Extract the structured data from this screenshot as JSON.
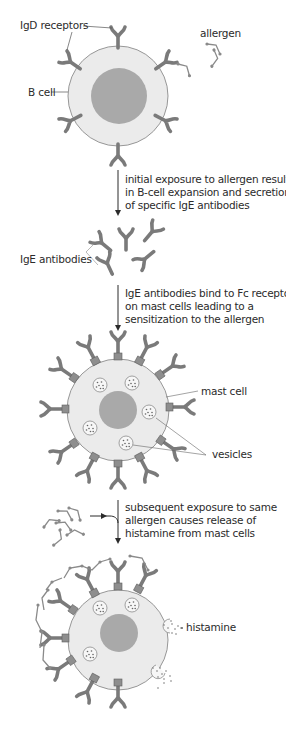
{
  "diagram": {
    "colors": {
      "cell_fill": "#ebebeb",
      "cell_stroke": "#8c8c8c",
      "nucleus": "#a9a9a9",
      "receptor": "#7a7a7a",
      "fc_receptor": "#8a8a8a",
      "allergen": "#8a8a8a",
      "text": "#2b2b2b",
      "arrow": "#2b2b2b"
    },
    "stage1": {
      "labels": {
        "igd_receptors": "IgD receptors",
        "b_cell": "B cell",
        "allergen": "allergen"
      }
    },
    "step1": {
      "caption_lines": [
        "initial exposure to allergen results",
        "in B-cell expansion and secretion",
        "of specific IgE antibodies"
      ]
    },
    "stage2": {
      "labels": {
        "ige_antibodies": "IgE antibodies"
      }
    },
    "step2": {
      "caption_lines": [
        "IgE antibodies bind to Fc receptors",
        "on mast cells leading to a",
        "sensitization to the allergen"
      ]
    },
    "stage3": {
      "labels": {
        "mast_cell": "mast cell",
        "vesicles": "vesicles"
      }
    },
    "step3": {
      "caption_lines": [
        "subsequent exposure to same",
        "allergen causes release of",
        "histamine from mast cells"
      ]
    },
    "stage4": {
      "labels": {
        "histamine": "histamine"
      }
    }
  }
}
